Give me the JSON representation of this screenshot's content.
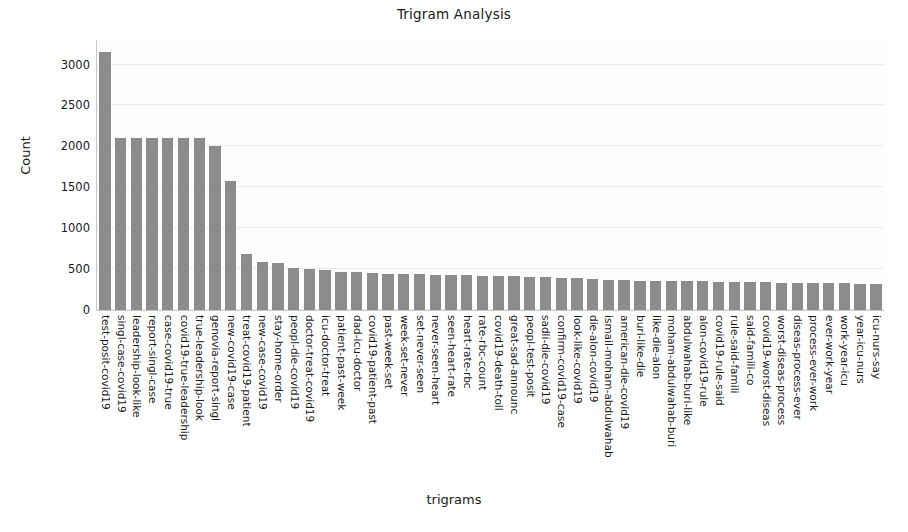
{
  "chart_data": {
    "type": "bar",
    "title": "Trigram Analysis",
    "xlabel": "trigrams",
    "ylabel": "Count",
    "ylim": [
      0,
      3300
    ],
    "yticks": [
      0,
      500,
      1000,
      1500,
      2000,
      2500,
      3000
    ],
    "ytick_labels": [
      "0",
      "500",
      "1000",
      "1500",
      "2000",
      "2500",
      "3000"
    ],
    "grid": true,
    "legend": null,
    "bar_color": "#8c8c8c",
    "categories": [
      "test-posit-covid19",
      "singl-case-covid19",
      "leadership-look-like",
      "report-singl-case",
      "case-covid19-true",
      "covid19-true-leadership",
      "true-leadership-look",
      "genovia-report-singl",
      "new-covid19-case",
      "treat-covid19-patient",
      "new-case-covid19",
      "stay-home-order",
      "peopl-die-covid19",
      "doctor-treat-covid19",
      "icu-doctor-treat",
      "patient-past-week",
      "dad-icu-doctor",
      "covid19-patient-past",
      "past-week-set",
      "week-set-never",
      "set-never-seen",
      "never-seen-heart",
      "seen-heart-rate",
      "heart-rate-rbc",
      "rate-rbc-count",
      "covid19-death-toll",
      "great-sad-announc",
      "peopl-test-posit",
      "sadli-die-covid19",
      "confirm-covid19-case",
      "look-like-covid19",
      "die-alon-covid19",
      "ismail-moham-abdulwahab",
      "american-die-covid19",
      "buri-like-die",
      "like-die-alon",
      "moham-abdulwahab-buri",
      "abdulwahab-buri-like",
      "alon-covid19-rule",
      "covid19-rule-said",
      "rule-said-famili",
      "said-famili-co",
      "covid19-worst-diseas",
      "worst-diseas-process",
      "diseas-process-ever",
      "process-ever-work",
      "ever-work-year",
      "work-year-icu",
      "year-icu-nurs",
      "icu-nurs-say"
    ],
    "values": [
      3150,
      2100,
      2100,
      2100,
      2100,
      2100,
      2100,
      2000,
      1580,
      680,
      590,
      570,
      510,
      500,
      490,
      470,
      460,
      450,
      440,
      440,
      435,
      430,
      430,
      425,
      420,
      415,
      410,
      400,
      400,
      395,
      390,
      385,
      370,
      365,
      360,
      358,
      355,
      352,
      350,
      348,
      345,
      342,
      338,
      335,
      332,
      330,
      328,
      326,
      324,
      322
    ]
  }
}
